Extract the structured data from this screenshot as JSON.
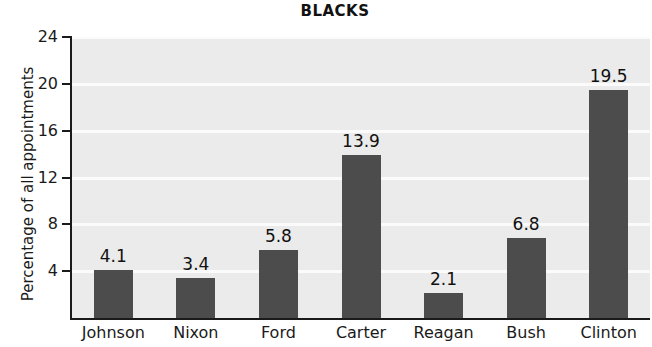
{
  "chart_data": {
    "type": "bar",
    "title": "BLACKS",
    "xlabel": "",
    "ylabel": "Percentage of all appointments",
    "categories": [
      "Johnson",
      "Nixon",
      "Ford",
      "Carter",
      "Reagan",
      "Bush",
      "Clinton"
    ],
    "values": [
      4.1,
      3.4,
      5.8,
      13.9,
      2.1,
      6.8,
      19.5
    ],
    "value_labels": [
      "4.1",
      "3.4",
      "5.8",
      "13.9",
      "2.1",
      "6.8",
      "19.5"
    ],
    "yticks": [
      4,
      8,
      12,
      16,
      20,
      24
    ],
    "ytick_labels": [
      "4",
      "8",
      "12",
      "16",
      "20",
      "24"
    ],
    "ylim": [
      0,
      24
    ],
    "grid": true,
    "legend": false,
    "colors": {
      "bar": "#4c4c4c",
      "plot_background": "#ebebeb",
      "gridline": "#fbfbfb",
      "axis": "#1a1a1a",
      "text": "#111111",
      "page_background": "#ffffff"
    }
  }
}
